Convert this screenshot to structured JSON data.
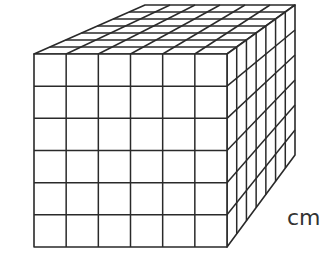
{
  "figure": {
    "front_columns": 6,
    "front_rows": 6,
    "depth": 7,
    "unit_label": "cm",
    "line_color": "#2a2a2a",
    "face_color": "#ffffff",
    "corners": {
      "front_top_left": [
        34,
        54
      ],
      "front_top_right": [
        227,
        54
      ],
      "front_bottom_right": [
        227,
        247
      ],
      "front_bottom_left": [
        34,
        247
      ],
      "back_top_left": [
        145,
        5
      ],
      "back_top_right": [
        295,
        5
      ],
      "back_bottom_right": [
        295,
        155
      ]
    }
  }
}
